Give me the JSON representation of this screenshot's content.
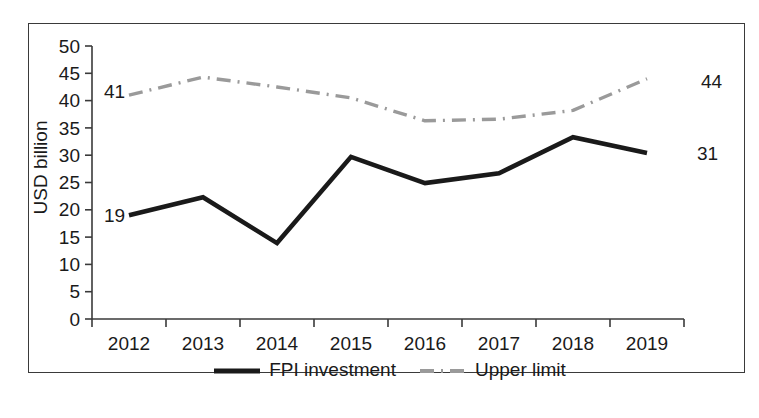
{
  "chart_data": {
    "type": "line",
    "title": "",
    "xlabel": "",
    "ylabel": "USD billion",
    "categories": [
      "2012",
      "2013",
      "2014",
      "2015",
      "2016",
      "2017",
      "2018",
      "2019"
    ],
    "ylim": [
      0,
      50
    ],
    "yticks": [
      "0",
      "5",
      "10",
      "15",
      "20",
      "25",
      "30",
      "35",
      "40",
      "45",
      "50"
    ],
    "grid": false,
    "legend_position": "bottom",
    "series": [
      {
        "name": "FPI investment",
        "style": "solid",
        "color": "#1a1a1a",
        "values": [
          19.0,
          22.3,
          13.9,
          29.7,
          24.9,
          26.7,
          33.3,
          30.4
        ],
        "point_labels": [
          {
            "category": "2012",
            "text": "19",
            "anchor": "left"
          },
          {
            "category": "2019",
            "text": "31",
            "anchor": "right"
          }
        ]
      },
      {
        "name": "Upper limit",
        "style": "dash-dot",
        "color": "#9a9a9a",
        "values": [
          41.0,
          44.3,
          42.5,
          40.5,
          36.3,
          36.6,
          38.2,
          44.0
        ],
        "point_labels": [
          {
            "category": "2012",
            "text": "41",
            "anchor": "left"
          },
          {
            "category": "2019",
            "text": "44",
            "anchor": "right"
          }
        ]
      }
    ]
  },
  "legend": {
    "entries": [
      {
        "label": "FPI investment",
        "swatch": "solid-line-swatch"
      },
      {
        "label": "Upper limit",
        "swatch": "dash-dot-line-swatch"
      }
    ]
  },
  "axes": {
    "y_tick_labels": [
      "50",
      "45",
      "40",
      "35",
      "30",
      "25",
      "20",
      "15",
      "10",
      "5",
      "0"
    ],
    "x_tick_labels": [
      "2012",
      "2013",
      "2014",
      "2015",
      "2016",
      "2017",
      "2018",
      "2019"
    ],
    "y_axis_title": "USD billion"
  },
  "annotations": {
    "fpi_first": "19",
    "fpi_last": "31",
    "limit_first": "41",
    "limit_last": "44"
  },
  "colors": {
    "fpi_line": "#1a1a1a",
    "limit_line": "#9a9a9a",
    "axis": "#3a3a3a",
    "frame": "#3a3a3a",
    "background": "#ffffff"
  }
}
